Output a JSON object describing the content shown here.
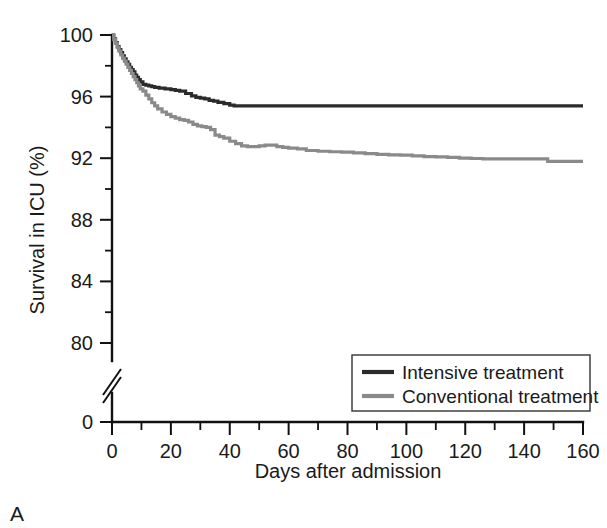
{
  "figure": {
    "panel_letter": "A",
    "background_color": "#ffffff"
  },
  "chart_data": {
    "type": "line",
    "subtype": "kaplan-meier-step",
    "title": "",
    "xlabel": "Days after admission",
    "ylabel": "Survival in ICU (%)",
    "xlim": [
      0,
      160
    ],
    "ylim": [
      80,
      100
    ],
    "y_axis_break": true,
    "y_axis_break_note": "axis broken between 0 and 80",
    "xticks": [
      0,
      20,
      40,
      60,
      80,
      100,
      120,
      140,
      160
    ],
    "xticklabels": [
      "0",
      "20",
      "40",
      "60",
      "80",
      "100",
      "120",
      "140",
      "160"
    ],
    "x_minor_ticks": [
      10,
      30,
      50,
      70,
      90,
      110,
      130,
      150
    ],
    "yticks": [
      0,
      80,
      84,
      88,
      92,
      96,
      100
    ],
    "yticklabels": [
      "0",
      "80",
      "84",
      "88",
      "92",
      "96",
      "100"
    ],
    "y_minor_ticks": [
      82,
      86,
      90,
      94,
      98
    ],
    "grid": false,
    "legend_position": "lower right",
    "series": [
      {
        "name": "Intensive treatment",
        "color": "#2b2b2b",
        "linewidth": 3.2,
        "points": [
          [
            0,
            100.0
          ],
          [
            0.6,
            99.75
          ],
          [
            1.2,
            99.5
          ],
          [
            1.8,
            99.25
          ],
          [
            2.4,
            99.05
          ],
          [
            3.0,
            98.85
          ],
          [
            3.6,
            98.65
          ],
          [
            4.2,
            98.45
          ],
          [
            4.8,
            98.25
          ],
          [
            5.4,
            98.1
          ],
          [
            6.0,
            97.9
          ],
          [
            6.6,
            97.75
          ],
          [
            7.2,
            97.6
          ],
          [
            7.8,
            97.4
          ],
          [
            8.4,
            97.25
          ],
          [
            9.0,
            97.1
          ],
          [
            9.6,
            96.95
          ],
          [
            10.5,
            96.8
          ],
          [
            11.5,
            96.75
          ],
          [
            12.5,
            96.7
          ],
          [
            13.5,
            96.65
          ],
          [
            14.5,
            96.6
          ],
          [
            16.0,
            96.55
          ],
          [
            18.0,
            96.5
          ],
          [
            20.0,
            96.45
          ],
          [
            21.5,
            96.4
          ],
          [
            23.0,
            96.35
          ],
          [
            25.0,
            96.2
          ],
          [
            27.0,
            96.05
          ],
          [
            28.5,
            95.95
          ],
          [
            30.0,
            95.9
          ],
          [
            31.5,
            95.85
          ],
          [
            33.0,
            95.75
          ],
          [
            34.5,
            95.7
          ],
          [
            36.0,
            95.62
          ],
          [
            38.0,
            95.55
          ],
          [
            40.0,
            95.45
          ],
          [
            41.5,
            95.4
          ],
          [
            44.0,
            95.4
          ],
          [
            50.0,
            95.4
          ],
          [
            60.0,
            95.4
          ],
          [
            70.0,
            95.4
          ],
          [
            80.0,
            95.4
          ],
          [
            90.0,
            95.4
          ],
          [
            100.0,
            95.4
          ],
          [
            110.0,
            95.4
          ],
          [
            120.0,
            95.4
          ],
          [
            130.0,
            95.4
          ],
          [
            140.0,
            95.4
          ],
          [
            150.0,
            95.4
          ],
          [
            160.0,
            95.4
          ]
        ]
      },
      {
        "name": "Conventional treatment",
        "color": "#8a8a8a",
        "linewidth": 3.2,
        "points": [
          [
            0,
            100.0
          ],
          [
            0.6,
            99.7
          ],
          [
            1.2,
            99.45
          ],
          [
            1.8,
            99.2
          ],
          [
            2.4,
            98.95
          ],
          [
            3.0,
            98.7
          ],
          [
            3.6,
            98.5
          ],
          [
            4.2,
            98.3
          ],
          [
            4.8,
            98.1
          ],
          [
            5.4,
            97.9
          ],
          [
            6.0,
            97.7
          ],
          [
            6.6,
            97.5
          ],
          [
            7.2,
            97.3
          ],
          [
            7.8,
            97.1
          ],
          [
            8.4,
            96.9
          ],
          [
            9.0,
            96.7
          ],
          [
            9.6,
            96.5
          ],
          [
            10.5,
            96.35
          ],
          [
            11.5,
            96.1
          ],
          [
            12.5,
            95.85
          ],
          [
            13.5,
            95.6
          ],
          [
            14.5,
            95.4
          ],
          [
            15.5,
            95.2
          ],
          [
            17.0,
            95.0
          ],
          [
            18.5,
            94.85
          ],
          [
            20.0,
            94.7
          ],
          [
            21.5,
            94.6
          ],
          [
            23.0,
            94.5
          ],
          [
            24.5,
            94.45
          ],
          [
            26.0,
            94.35
          ],
          [
            27.5,
            94.2
          ],
          [
            29.0,
            94.1
          ],
          [
            30.5,
            94.05
          ],
          [
            32.0,
            94.0
          ],
          [
            33.5,
            93.85
          ],
          [
            35.0,
            93.5
          ],
          [
            36.5,
            93.4
          ],
          [
            38.0,
            93.3
          ],
          [
            40.0,
            93.1
          ],
          [
            42.0,
            92.95
          ],
          [
            44.0,
            92.8
          ],
          [
            46.0,
            92.75
          ],
          [
            48.0,
            92.75
          ],
          [
            50.0,
            92.8
          ],
          [
            52.0,
            92.85
          ],
          [
            54.0,
            92.85
          ],
          [
            56.0,
            92.75
          ],
          [
            58.0,
            92.7
          ],
          [
            60.0,
            92.65
          ],
          [
            63.0,
            92.6
          ],
          [
            66.0,
            92.5
          ],
          [
            70.0,
            92.45
          ],
          [
            74.0,
            92.42
          ],
          [
            78.0,
            92.4
          ],
          [
            82.0,
            92.35
          ],
          [
            86.0,
            92.3
          ],
          [
            90.0,
            92.25
          ],
          [
            94.0,
            92.22
          ],
          [
            98.0,
            92.2
          ],
          [
            102.0,
            92.15
          ],
          [
            106.0,
            92.1
          ],
          [
            110.0,
            92.08
          ],
          [
            114.0,
            92.05
          ],
          [
            118.0,
            92.0
          ],
          [
            122.0,
            91.98
          ],
          [
            126.0,
            91.95
          ],
          [
            130.0,
            91.95
          ],
          [
            134.0,
            91.95
          ],
          [
            138.0,
            91.95
          ],
          [
            142.0,
            91.95
          ],
          [
            146.0,
            91.95
          ],
          [
            148.0,
            91.8
          ],
          [
            152.0,
            91.8
          ],
          [
            156.0,
            91.8
          ],
          [
            160.0,
            91.8
          ]
        ]
      }
    ],
    "legend": [
      {
        "label": "Intensive treatment",
        "color": "#2b2b2b"
      },
      {
        "label": "Conventional treatment",
        "color": "#8a8a8a"
      }
    ]
  }
}
